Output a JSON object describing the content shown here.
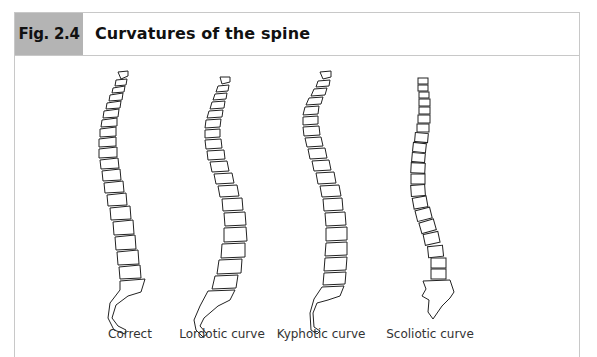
{
  "figure": {
    "number_label": "Fig. 2.4",
    "title": "Curvatures of the spine",
    "label_bg_color": "#b4b4b4",
    "border_color": "#c8c8c8"
  },
  "spines": [
    {
      "id": "correct",
      "caption": "Correct"
    },
    {
      "id": "lordotic",
      "caption": "Lordotic curve"
    },
    {
      "id": "kyphotic",
      "caption": "Kyphotic curve"
    },
    {
      "id": "scoliotic",
      "caption": "Scoliotic curve"
    }
  ]
}
